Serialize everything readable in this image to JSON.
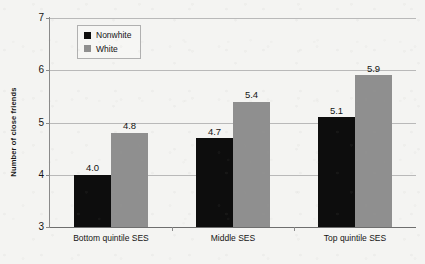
{
  "chart_data": {
    "type": "bar",
    "title": "",
    "subtitle": "",
    "xlabel": "",
    "ylabel": "Number of close friends",
    "categories": [
      "Bottom quintile SES",
      "Middle SES",
      "Top quintile SES"
    ],
    "series": [
      {
        "name": "Nonwhite",
        "color": "#0d0d0d",
        "values": [
          4.0,
          4.7,
          5.1
        ],
        "labels": [
          "4.0",
          "4.7",
          "5.1"
        ]
      },
      {
        "name": "White",
        "color": "#8f8f8f",
        "values": [
          4.8,
          5.4,
          5.9
        ],
        "labels": [
          "4.8",
          "5.4",
          "5.9"
        ]
      }
    ],
    "ylim": [
      3,
      7
    ],
    "yticks": [
      3,
      4,
      5,
      6,
      7
    ],
    "ytick_labels": [
      "3",
      "4",
      "5",
      "6",
      "7"
    ],
    "grid": "horizontal",
    "legend_position": "top-left-inside",
    "background_color": "#f4f4f2",
    "gridline_color": "#b9b9b9",
    "axis_color": "#8a8a8a"
  },
  "legend": {
    "items": [
      {
        "label": "Nonwhite",
        "swatch": "legend-swatch-nonwhite"
      },
      {
        "label": "White",
        "swatch": "legend-swatch-white"
      }
    ]
  }
}
